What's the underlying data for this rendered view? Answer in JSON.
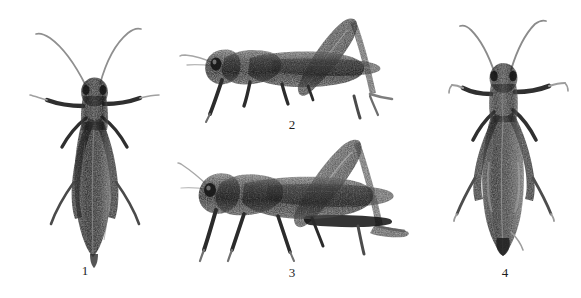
{
  "figure": {
    "type": "scientific-specimen-plate",
    "background_color": "#ffffff",
    "ink_color": "#1d1d1d",
    "width": 581,
    "height": 298,
    "panel_count": 4
  },
  "panels": [
    {
      "id": "panel-1",
      "caption": "1",
      "view": "dorsal",
      "orientation": "head-up",
      "caption_x": 85,
      "caption_y": 270,
      "body": {
        "x": 35,
        "y": 22,
        "w": 112,
        "h": 232
      }
    },
    {
      "id": "panel-2",
      "caption": "2",
      "view": "lateral",
      "orientation": "head-left",
      "caption_x": 292,
      "caption_y": 118,
      "body": {
        "x": 190,
        "y": 14,
        "w": 205,
        "h": 104
      }
    },
    {
      "id": "panel-3",
      "caption": "3",
      "view": "lateral",
      "orientation": "head-left",
      "caption_x": 292,
      "caption_y": 266,
      "body": {
        "x": 188,
        "y": 136,
        "w": 232,
        "h": 124
      }
    },
    {
      "id": "panel-4",
      "caption": "4",
      "view": "dorsal",
      "orientation": "head-up",
      "caption_x": 505,
      "caption_y": 266,
      "body": {
        "x": 455,
        "y": 14,
        "w": 110,
        "h": 238
      }
    }
  ],
  "palette": {
    "paper": "#ffffff",
    "body_dark": "#262626",
    "body_mid": "#555555",
    "body_light": "#8c8c8c",
    "highlight": "#cfcfcf",
    "appendage": "#3a3a3a",
    "antenna": "#9b9b9b",
    "caption_text": "#1d1d1d"
  }
}
